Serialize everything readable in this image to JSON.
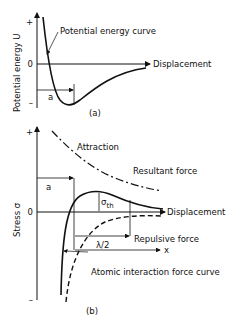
{
  "panel_a": {
    "caption": "(a)",
    "y_axis_label": "Potential energy U",
    "y_plus": "+",
    "y_zero": "0",
    "y_minus": "–",
    "x_axis_label": "Displacement",
    "curve_label": "Potential energy curve",
    "a_label": "a"
  },
  "panel_b": {
    "caption": "(b)",
    "y_axis_label": "Stress σ",
    "y_plus": "+",
    "y_zero": "0",
    "y_minus": "–",
    "x_axis_label": "Displacement",
    "attraction_label": "Attraction",
    "resultant_label": "Resultant force",
    "repulsive_label": "Repulsive force",
    "atomic_label": "Atomic interaction force curve",
    "sigma_th": "σ",
    "sigma_sub": "th",
    "a_label": "a",
    "lambda_label": "λ/2",
    "x_label": "x"
  }
}
